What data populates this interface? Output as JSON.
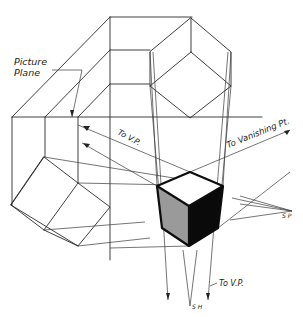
{
  "figure": {
    "labels": {
      "picture_plane_line1": "Picture",
      "picture_plane_line2": "Plane",
      "to_vp_upper": "To V.P.",
      "to_vanishing_pt": "To Vanishing Pt.",
      "to_vp_lower": "To V.P.",
      "sp_right": "S P",
      "sp_bottom": "S H"
    },
    "colors": {
      "line": "#2a2a2a",
      "face_left": "#9a9a9a",
      "face_right": "#0a0a0a",
      "face_top": "#ffffff",
      "background": "#ffffff"
    }
  }
}
